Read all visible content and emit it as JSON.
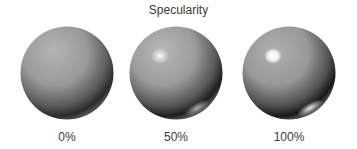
{
  "title": "Specularity",
  "spheres": [
    {
      "label": "0%",
      "specularity": 0,
      "base_color": "#9a9a9a",
      "shadow_color": "#1e1e1e",
      "highlight_color": "#ffffff"
    },
    {
      "label": "50%",
      "specularity": 50,
      "base_color": "#9a9a9a",
      "shadow_color": "#1e1e1e",
      "highlight_color": "#ffffff"
    },
    {
      "label": "100%",
      "specularity": 100,
      "base_color": "#9a9a9a",
      "shadow_color": "#1e1e1e",
      "highlight_color": "#ffffff"
    }
  ]
}
